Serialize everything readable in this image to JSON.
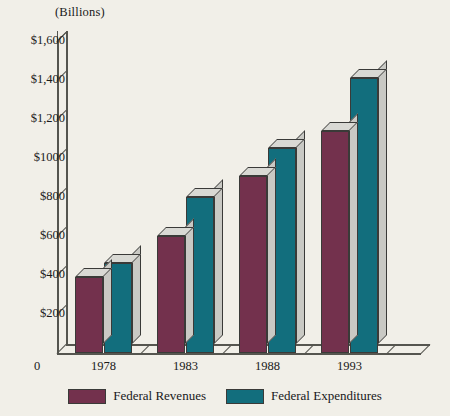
{
  "chart_data": {
    "type": "bar",
    "title": "",
    "subtitle": "",
    "unit_caption": "(Billions)",
    "xlabel": "",
    "ylabel": "",
    "categories": [
      "1978",
      "1983",
      "1988",
      "1993"
    ],
    "series": [
      {
        "name": "Federal Revenues",
        "color": "#73314d",
        "values": [
          390,
          600,
          910,
          1140
        ]
      },
      {
        "name": "Federal Expenditures",
        "color": "#126e7d",
        "values": [
          460,
          800,
          1050,
          1410
        ]
      }
    ],
    "ylim": [
      0,
      1700
    ],
    "ytick_values": [
      200,
      400,
      600,
      800,
      1000,
      1200,
      1400,
      1600
    ],
    "ytick_labels": [
      "$200",
      "$400",
      "$600",
      "$800",
      "$1000",
      "$1,200",
      "$1,400",
      "$1,600"
    ],
    "origin_label": "0",
    "grid": false,
    "legend_position": "bottom",
    "style": "3d-column"
  },
  "legend": {
    "items": [
      {
        "label": "Federal Revenues",
        "color": "#73314d"
      },
      {
        "label": "Federal Expenditures",
        "color": "#126e7d"
      }
    ]
  },
  "colors": {
    "background": "#f1efe8",
    "revenues": "#73314d",
    "expenditures": "#126e7d",
    "bar_top": "#d9d9d4",
    "bar_side": "#c9c9c4",
    "axis": "#55554f",
    "text": "#1a1a1a"
  }
}
